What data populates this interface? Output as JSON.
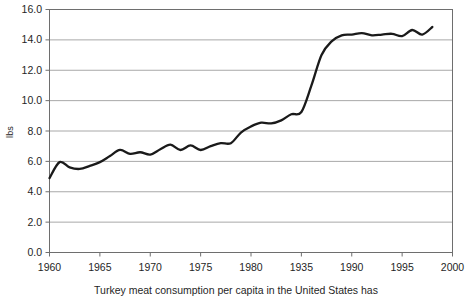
{
  "chart_data": {
    "type": "line",
    "title": "",
    "xlabel": "",
    "ylabel": "lbs",
    "xlim": [
      1960,
      2000
    ],
    "ylim": [
      0.0,
      16.0
    ],
    "grid": true,
    "grid_axis": "y",
    "legend": false,
    "legend_position": "none",
    "line_color": "#1a1a1a",
    "grid_color": "#a8a8a8",
    "axis_color": "#6e6e6e",
    "x_tick_labels": [
      "1960",
      "1965",
      "1970",
      "1975",
      "1980",
      "1935",
      "1990",
      "1995",
      "2000"
    ],
    "x_tick_values": [
      1960,
      1965,
      1970,
      1975,
      1980,
      1985,
      1990,
      1995,
      2000
    ],
    "y_tick_labels": [
      "16.0",
      "14.0",
      "12.0",
      "10.0",
      "8.0",
      "6.0",
      "4.0",
      "2.0",
      "0.0"
    ],
    "y_tick_values": [
      16.0,
      14.0,
      12.0,
      10.0,
      8.0,
      6.0,
      4.0,
      2.0,
      0.0
    ],
    "series": [
      {
        "name": "Turkey meat consumption per capita (lbs)",
        "x": [
          1960,
          1961,
          1962,
          1963,
          1964,
          1965,
          1966,
          1967,
          1968,
          1969,
          1970,
          1971,
          1972,
          1973,
          1974,
          1975,
          1976,
          1977,
          1978,
          1979,
          1980,
          1981,
          1982,
          1983,
          1984,
          1985,
          1986,
          1987,
          1988,
          1989,
          1990,
          1991,
          1992,
          1993,
          1994,
          1995,
          1996,
          1997,
          1998
        ],
        "values": [
          4.9,
          5.95,
          5.6,
          5.5,
          5.7,
          5.95,
          6.35,
          6.75,
          6.5,
          6.6,
          6.45,
          6.8,
          7.1,
          6.75,
          7.05,
          6.75,
          7.0,
          7.2,
          7.2,
          7.9,
          8.3,
          8.55,
          8.5,
          8.7,
          9.1,
          9.25,
          11.0,
          13.0,
          13.9,
          14.3,
          14.35,
          14.45,
          14.3,
          14.35,
          14.4,
          14.25,
          14.65,
          14.35,
          14.85
        ]
      }
    ],
    "caption": "Turkey meat consumption per capita in the United States has"
  },
  "axis": {
    "y_title": "lbs"
  },
  "caption": {
    "text": "Turkey meat consumption per capita in the United States has"
  }
}
